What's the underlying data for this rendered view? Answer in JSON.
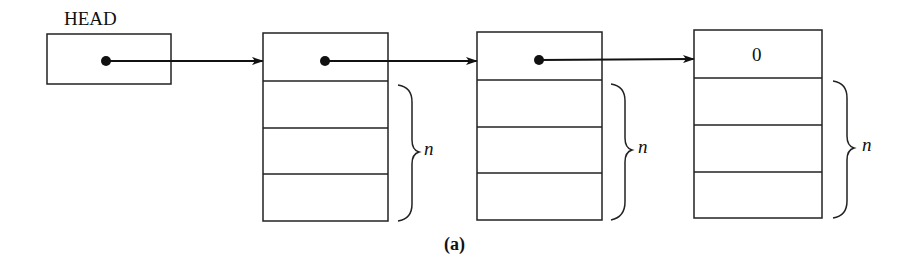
{
  "figure": {
    "caption": "(a)",
    "head_label": "HEAD",
    "nodes": [
      {
        "id": "node-1",
        "link_field": "",
        "data_fields": 3,
        "brace_label": "n"
      },
      {
        "id": "node-2",
        "link_field": "",
        "data_fields": 3,
        "brace_label": "n"
      },
      {
        "id": "node-3",
        "link_field": "0",
        "data_fields": 3,
        "brace_label": "n"
      }
    ]
  }
}
